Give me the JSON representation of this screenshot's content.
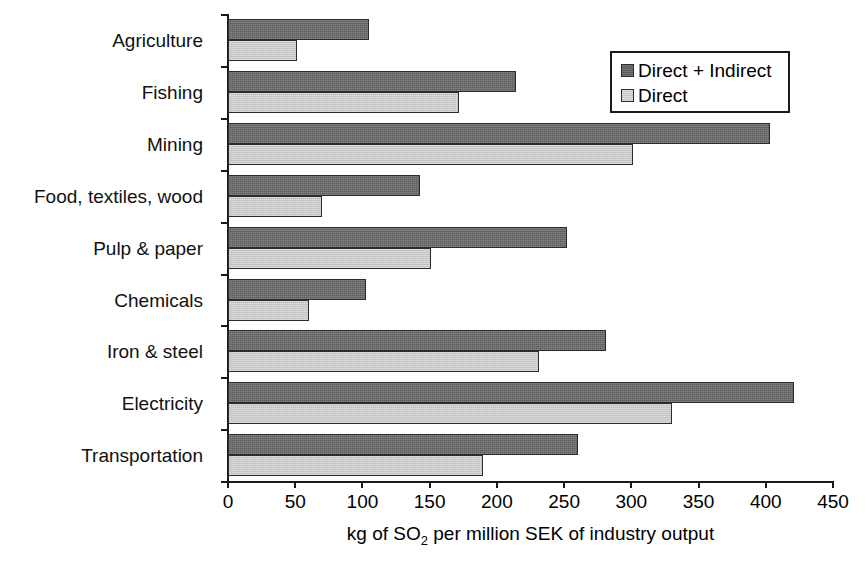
{
  "chart_data": {
    "type": "bar",
    "orientation": "horizontal",
    "title": "",
    "xlabel": "kg of SO2 per million SEK of industry output",
    "xlabel_parts": {
      "before": "kg of SO",
      "sub": "2",
      "after": " per million SEK of industry output"
    },
    "ylabel": "",
    "xlim": [
      0,
      450
    ],
    "xticks": [
      0,
      50,
      100,
      150,
      200,
      250,
      300,
      350,
      400,
      450
    ],
    "xtick_labels": [
      "0",
      "50",
      "100",
      "150",
      "200",
      "250",
      "300",
      "350",
      "400",
      "450"
    ],
    "grid": false,
    "legend_position": "top-right",
    "categories": [
      "Agriculture",
      "Fishing",
      "Mining",
      "Food, textiles, wood",
      "Pulp & paper",
      "Chemicals",
      "Iron & steel",
      "Electricity",
      "Transportation"
    ],
    "series": [
      {
        "name": "Direct + Indirect",
        "color": "#5c5c5c",
        "values": [
          105,
          214,
          403,
          143,
          252,
          103,
          281,
          421,
          260
        ]
      },
      {
        "name": "Direct",
        "color": "#c9c9c9",
        "values": [
          51,
          172,
          301,
          70,
          151,
          60,
          231,
          330,
          190
        ]
      }
    ]
  },
  "legend": {
    "entries": [
      {
        "label": "Direct + Indirect",
        "swatch": "dark"
      },
      {
        "label": "Direct",
        "swatch": "light"
      }
    ]
  },
  "colors": {
    "series_dark": "#5c5c5c",
    "series_light": "#c9c9c9",
    "axis": "#1a1a1a",
    "background": "#ffffff"
  }
}
